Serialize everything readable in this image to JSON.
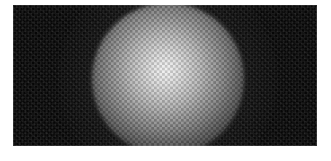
{
  "window": {
    "title": "Beam Profile Capture",
    "page_background": "#ffffff"
  },
  "capture": {
    "name": "sensor-capture",
    "alt_text": "Grayscale sensor capture showing a bright circular Gaussian beam spot modulated by a fine checkerboard microlens array on a dark noisy background",
    "frame": {
      "left_px": 13,
      "top_px": 5,
      "width_px": 304,
      "height_px": 141,
      "background_color": "#060606",
      "border_color": "#1a1a1a"
    }
  },
  "beam": {
    "label": "beam-spot",
    "center_x_px": 168,
    "center_y_px": 79,
    "radius_px": 76,
    "peak_color": "#f2f2f2",
    "edge_color": "#070707",
    "peak_offset_x_pct": 48,
    "peak_offset_y_pct": 44
  },
  "grid_overlay": {
    "label": "microlens-checkerboard",
    "cell_size_px": 2.7,
    "pattern": "checkerboard",
    "light_cell_color": "rgba(255,255,255,0.17)",
    "dark_cell_color": "rgba(0,0,0,0.17)"
  },
  "background_noise": {
    "label": "sensor-noise",
    "visible": true,
    "intensity": "low"
  }
}
